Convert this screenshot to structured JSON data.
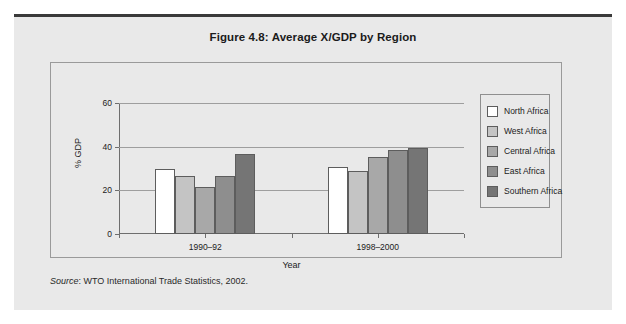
{
  "figure": {
    "title": "Figure 4.8:  Average X/GDP by Region",
    "source_word": "Source",
    "source_rest": ": WTO International Trade Statistics, 2002."
  },
  "legend": {
    "items": [
      {
        "label": "North Africa",
        "color": "#ffffff"
      },
      {
        "label": "West Africa",
        "color": "#c4c4c4"
      },
      {
        "label": "Central Africa",
        "color": "#a8a8a8"
      },
      {
        "label": "East Africa",
        "color": "#8e8e8e"
      },
      {
        "label": "Southern Africa",
        "color": "#757575"
      }
    ]
  },
  "chart_data": {
    "type": "bar",
    "title": "Figure 4.8:  Average X/GDP by Region",
    "xlabel": "Year",
    "ylabel": "% GDP",
    "categories": [
      "1990–92",
      "1998–2000"
    ],
    "ylim": [
      0,
      60
    ],
    "yticks": [
      0,
      20,
      40,
      60
    ],
    "ytick_labels": [
      "0",
      "20",
      "40",
      "60"
    ],
    "grid": true,
    "legend_position": "right",
    "series": [
      {
        "name": "North Africa",
        "color": "#ffffff",
        "values": [
          30,
          30.5
        ]
      },
      {
        "name": "West Africa",
        "color": "#c4c4c4",
        "values": [
          26.5,
          29
        ]
      },
      {
        "name": "Central Africa",
        "color": "#a8a8a8",
        "values": [
          21.5,
          35.5
        ]
      },
      {
        "name": "East Africa",
        "color": "#8e8e8e",
        "values": [
          26.5,
          38.5
        ]
      },
      {
        "name": "Southern Africa",
        "color": "#757575",
        "values": [
          36.5,
          39.5
        ]
      }
    ]
  }
}
